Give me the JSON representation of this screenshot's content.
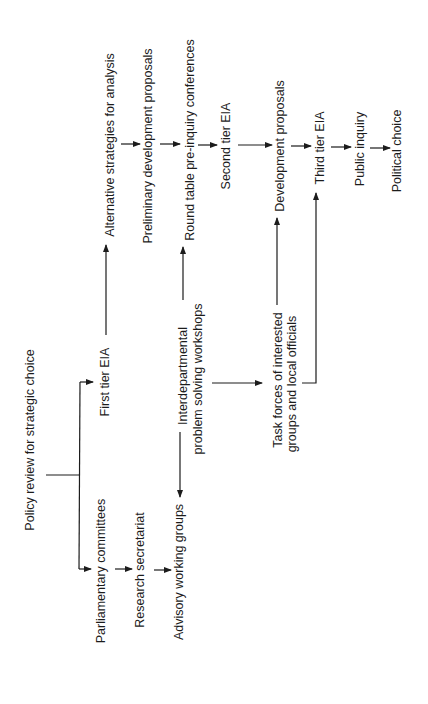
{
  "diagram": {
    "type": "flowchart",
    "orientation": "rotated-90-ccw",
    "colors": {
      "background": "#ffffff",
      "ink": "#1c1c1c"
    },
    "nodes": {
      "policy_review": "Policy review for strategic choice",
      "first_tier_eia": "First tier EIA",
      "parliamentary_committees": "Parliamentary committees",
      "research_secretariat": "Research secretariat",
      "advisory_working_groups": "Advisory working groups",
      "interdepartmental_1": "Interdepartmental",
      "interdepartmental_2": "problem solving workshops",
      "alternative_strategies": "Alternative strategies for analysis",
      "preliminary_proposals": "Preliminary development proposals",
      "round_table": "Round table pre-inquiry conferences",
      "second_tier_eia": "Second tier EIA",
      "task_forces_1": "Task forces of interested",
      "task_forces_2": "groups and local officials",
      "development_proposals": "Development proposals",
      "third_tier_eia": "Third tier EIA",
      "public_inquiry": "Public inquiry",
      "political_choice": "Political choice"
    },
    "edges": [
      [
        "Policy review for strategic choice",
        "First tier EIA"
      ],
      [
        "Policy review for strategic choice",
        "Parliamentary committees"
      ],
      [
        "Parliamentary committees",
        "Research secretariat"
      ],
      [
        "Research secretariat",
        "Advisory working groups"
      ],
      [
        "Interdepartmental problem solving workshops",
        "Advisory working groups"
      ],
      [
        "Interdepartmental problem solving workshops",
        "Round table pre-inquiry conferences"
      ],
      [
        "Interdepartmental problem solving workshops",
        "Task forces of interested groups and local officials"
      ],
      [
        "First tier EIA",
        "Alternative strategies for analysis"
      ],
      [
        "Alternative strategies for analysis",
        "Preliminary development proposals"
      ],
      [
        "Preliminary development proposals",
        "Round table pre-inquiry conferences"
      ],
      [
        "Round table pre-inquiry conferences",
        "Second tier EIA"
      ],
      [
        "Second tier EIA",
        "Development proposals"
      ],
      [
        "Task forces of interested groups and local officials",
        "Development proposals"
      ],
      [
        "Task forces of interested groups and local officials",
        "Third tier EIA"
      ],
      [
        "Development proposals",
        "Third tier EIA"
      ],
      [
        "Third tier EIA",
        "Public inquiry"
      ],
      [
        "Public inquiry",
        "Political choice"
      ]
    ]
  }
}
